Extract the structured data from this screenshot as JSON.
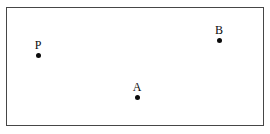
{
  "figure": {
    "type": "geometry-diagram",
    "background_color": "#ffffff",
    "rectangle": {
      "name": "bounding-rectangle",
      "stroke_color": "#464646",
      "fill_color": "#ffffff",
      "stroke_width": 1,
      "x": 6,
      "y": 7,
      "width": 258,
      "height": 119
    },
    "points": [
      {
        "label": "P",
        "x": 38,
        "y": 55,
        "dot_color": "#0b0b0b",
        "dot_radius": 2.5,
        "label_offset_x": 0,
        "label_offset_y": -4
      },
      {
        "label": "A",
        "x": 137,
        "y": 97,
        "dot_color": "#0b0b0b",
        "dot_radius": 2.5,
        "label_offset_x": 0,
        "label_offset_y": -4
      },
      {
        "label": "B",
        "x": 219,
        "y": 40,
        "dot_color": "#0b0b0b",
        "dot_radius": 2.5,
        "label_offset_x": 0,
        "label_offset_y": -4
      }
    ]
  }
}
